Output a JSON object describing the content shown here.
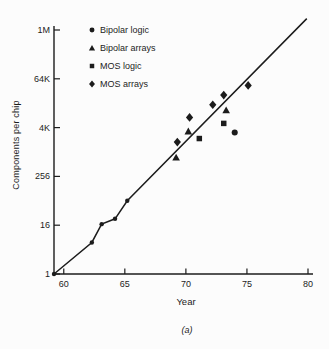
{
  "figure": {
    "background": "#fcfcfc",
    "ink_color": "#1c1c1c",
    "caption": "(a)",
    "xlabel": "Year",
    "ylabel": "Components per chip"
  },
  "chart_data": {
    "type": "scatter",
    "xlabel": "Year",
    "ylabel": "Components per chip",
    "y_scale": "log",
    "grid": false,
    "legend_position": "upper-left-inside",
    "xlim": [
      59.2,
      80
    ],
    "ylim": [
      1,
      1048576
    ],
    "x_ticks": [
      60,
      65,
      70,
      75,
      80
    ],
    "y_ticks": [
      {
        "label": "1",
        "value": 1
      },
      {
        "label": "16",
        "value": 16
      },
      {
        "label": "256",
        "value": 256
      },
      {
        "label": "4K",
        "value": 4096
      },
      {
        "label": "64K",
        "value": 65536
      },
      {
        "label": "1M",
        "value": 1048576
      }
    ],
    "series": [
      {
        "name": "Bipolar logic",
        "marker": "circle",
        "points": [
          {
            "year": 74.0,
            "components": 3100
          }
        ]
      },
      {
        "name": "Bipolar arrays",
        "marker": "triangle",
        "points": [
          {
            "year": 69.2,
            "components": 750
          },
          {
            "year": 70.2,
            "components": 3300
          },
          {
            "year": 73.3,
            "components": 11000
          }
        ]
      },
      {
        "name": "MOS logic",
        "marker": "square",
        "points": [
          {
            "year": 71.1,
            "components": 2200
          },
          {
            "year": 73.1,
            "components": 5200
          }
        ]
      },
      {
        "name": "MOS arrays",
        "marker": "diamond",
        "points": [
          {
            "year": 69.3,
            "components": 1800
          },
          {
            "year": 70.3,
            "components": 7300
          },
          {
            "year": 72.2,
            "components": 15000
          },
          {
            "year": 73.1,
            "components": 26000
          },
          {
            "year": 75.1,
            "components": 45000
          }
        ]
      }
    ],
    "trend_line": {
      "points": [
        {
          "year": 59.2,
          "components": 1
        },
        {
          "year": 62.3,
          "components": 6
        },
        {
          "year": 63.1,
          "components": 17
        },
        {
          "year": 64.2,
          "components": 23
        },
        {
          "year": 65.2,
          "components": 64
        },
        {
          "year": 79.9,
          "components": 2000000
        }
      ],
      "dotted_vertices": 5
    }
  }
}
